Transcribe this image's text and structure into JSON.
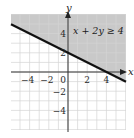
{
  "chart_data": {
    "type": "line",
    "title": "",
    "inequality": "x + 2y ≥ 4",
    "boundary_line": {
      "equation": "x + 2y = 4",
      "slope": -0.5,
      "y_intercept": 2,
      "x_intercept": 4,
      "style": "solid",
      "points": [
        [
          -6,
          5
        ],
        [
          0,
          2
        ],
        [
          4,
          0
        ],
        [
          6,
          -1
        ]
      ]
    },
    "shaded_region": "above",
    "xlabel": "x",
    "ylabel": "y",
    "xlim": [
      -6,
      6
    ],
    "ylim": [
      -6,
      6
    ],
    "x_ticks": [
      -4,
      -2,
      0,
      2,
      4
    ],
    "y_ticks": [
      4,
      2,
      -2,
      -4
    ],
    "x_tick_labels": [
      "−4",
      "−2",
      "0",
      "2",
      "4"
    ],
    "y_tick_labels": [
      "4",
      "2",
      "−2",
      "−4"
    ],
    "grid": true,
    "grid_step": 1,
    "colors": {
      "shade": "#c9c9c9",
      "grid": "#d4d4d4",
      "grid_on_shade": "#b8b8b8",
      "line": "#111111",
      "axis": "#333333"
    }
  }
}
